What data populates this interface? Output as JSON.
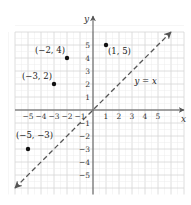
{
  "chart_data": {
    "type": "scatter",
    "title": "",
    "xlabel": "x",
    "ylabel": "y",
    "xlim": [
      -6,
      7
    ],
    "ylim": [
      -6.5,
      6
    ],
    "grid": true,
    "x_ticks": [
      -5,
      -4,
      -3,
      -2,
      -1,
      1,
      2,
      3,
      4,
      5
    ],
    "y_ticks": [
      -5,
      -4,
      -3,
      -2,
      -1,
      1,
      2,
      3,
      4,
      5
    ],
    "x_tick_labels": [
      "−5",
      "−4",
      "−3",
      "−2",
      "−1",
      "1",
      "2",
      "3",
      "4",
      "5"
    ],
    "y_tick_labels": [
      "−5",
      "−4",
      "−3",
      "−2",
      "−1",
      "1",
      "2",
      "3",
      "4",
      "5"
    ],
    "points": [
      {
        "x": -2,
        "y": 4,
        "label": "(−2, 4)"
      },
      {
        "x": 1,
        "y": 5,
        "label": "(1, 5)"
      },
      {
        "x": -3,
        "y": 2,
        "label": "(−3, 2)"
      },
      {
        "x": -5,
        "y": -3,
        "label": "(−5, −3)"
      }
    ],
    "lines": [
      {
        "equation": "y = x",
        "label": "y = x",
        "style": "dashed",
        "from": [
          -6,
          -6
        ],
        "to": [
          6,
          6
        ],
        "arrows": "both"
      }
    ]
  },
  "colors": {
    "grid": "#d6d6d6",
    "axis": "#555555",
    "points": "#111111",
    "line": "#555555"
  }
}
